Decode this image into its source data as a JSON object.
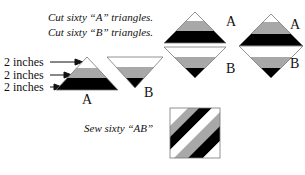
{
  "instructions": {
    "line1": "Cut sixty “A” triangles.",
    "line2": "Cut sixty “B” triangles.",
    "sew": "Sew sixty “AB”"
  },
  "measurements": [
    {
      "label": "2 inches",
      "band": "white"
    },
    {
      "label": "2 inches",
      "band": "gray"
    },
    {
      "label": "2 inches",
      "band": "black"
    }
  ],
  "triangle_labels": {
    "a_single": "A",
    "b_single": "B",
    "a_stack1": "A",
    "b_stack1": "B",
    "a_stack2": "A",
    "b_stack2": "B"
  },
  "colors": {
    "white_band": "#ffffff",
    "gray_band": "#a8a8a8",
    "black_band": "#000000",
    "outline": "#777777"
  }
}
